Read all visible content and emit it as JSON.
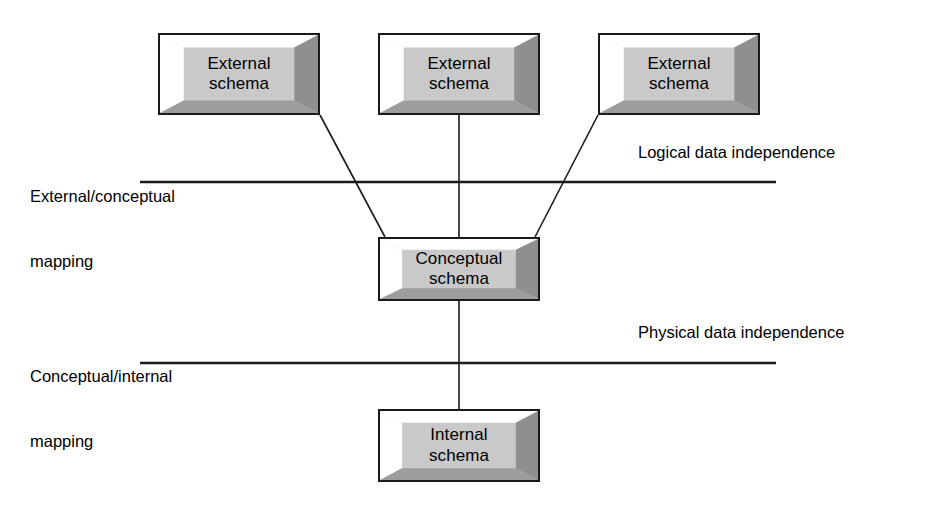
{
  "diagram": {
    "colors": {
      "box_fill": "#c9c9c9",
      "box_border": "#1a1a1a",
      "bevel_light": "#ffffff",
      "bevel_dark": "#8f8f8f",
      "bevel_mid": "#b4b4b4",
      "line": "#1a1a1a",
      "text": "#000000",
      "background": "#ffffff"
    },
    "boxes": [
      {
        "id": "external-schema-1",
        "line1": "External",
        "line2": "schema"
      },
      {
        "id": "external-schema-2",
        "line1": "External",
        "line2": "schema"
      },
      {
        "id": "external-schema-3",
        "line1": "External",
        "line2": "schema"
      },
      {
        "id": "conceptual-schema",
        "line1": "Conceptual",
        "line2": "schema"
      },
      {
        "id": "internal-schema",
        "line1": "Internal",
        "line2": "schema"
      }
    ],
    "captions": {
      "external_conceptual_mapping_line1": "External/conceptual",
      "external_conceptual_mapping_line2": "mapping",
      "logical_data_independence": "Logical data independence",
      "conceptual_internal_mapping_line1": "Conceptual/internal",
      "conceptual_internal_mapping_line2": "mapping",
      "physical_data_independence": "Physical data independence"
    }
  }
}
